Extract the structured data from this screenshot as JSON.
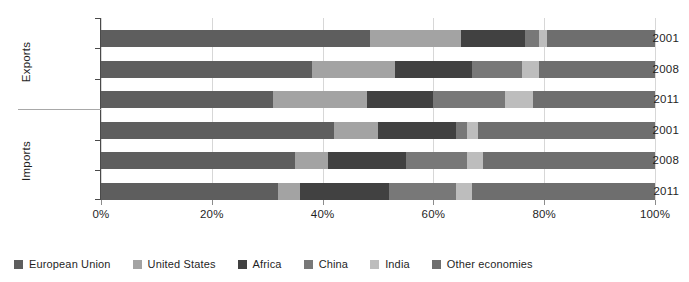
{
  "chart_data": {
    "type": "bar",
    "orientation": "horizontal",
    "stacked": "percent",
    "title": "",
    "subtitle": "",
    "xlabel": "",
    "ylabel": "",
    "xlim": [
      0,
      100
    ],
    "xticks": [
      0,
      20,
      40,
      60,
      80,
      100
    ],
    "xticklabels": [
      "0%",
      "20%",
      "40%",
      "60%",
      "80%",
      "100%"
    ],
    "grid": true,
    "grid_axis": "x",
    "legend_position": "bottom-left",
    "groups": [
      "Exports",
      "Imports"
    ],
    "categories": [
      "2001",
      "2008",
      "2011",
      "2001",
      "2008",
      "2011"
    ],
    "series": [
      {
        "name": "European Union",
        "color": "#5e5e5e",
        "values": [
          48.5,
          38.0,
          31.0,
          42.0,
          35.0,
          32.0
        ]
      },
      {
        "name": "United States",
        "color": "#a3a3a3",
        "values": [
          16.5,
          15.0,
          17.0,
          8.0,
          6.0,
          4.0
        ]
      },
      {
        "name": "Africa",
        "color": "#414141",
        "values": [
          11.5,
          14.0,
          12.0,
          14.0,
          14.0,
          16.0
        ]
      },
      {
        "name": "China",
        "color": "#787878",
        "values": [
          2.5,
          9.0,
          13.0,
          2.0,
          11.0,
          12.0
        ]
      },
      {
        "name": "India",
        "color": "#bdbdbd",
        "values": [
          1.5,
          3.0,
          5.0,
          2.0,
          3.0,
          3.0
        ]
      },
      {
        "name": "Other economies",
        "color": "#6e6e6e",
        "values": [
          19.5,
          21.0,
          22.0,
          32.0,
          31.0,
          33.0
        ]
      }
    ]
  },
  "axis": {
    "group_labels": [
      {
        "name": "Exports"
      },
      {
        "name": "Imports"
      }
    ],
    "category_labels": [
      "2001",
      "2008",
      "2011",
      "2001",
      "2008",
      "2011"
    ],
    "tick_labels": [
      "0%",
      "20%",
      "40%",
      "60%",
      "80%",
      "100%"
    ]
  },
  "legend": {
    "items": [
      {
        "label": "European Union",
        "color": "#5e5e5e"
      },
      {
        "label": "United States",
        "color": "#a3a3a3"
      },
      {
        "label": "Africa",
        "color": "#414141"
      },
      {
        "label": "China",
        "color": "#787878"
      },
      {
        "label": "India",
        "color": "#bdbdbd"
      },
      {
        "label": "Other economies",
        "color": "#6e6e6e"
      }
    ]
  }
}
